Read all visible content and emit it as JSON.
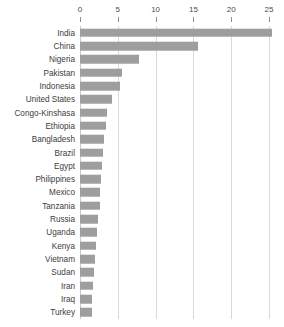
{
  "chart_data": {
    "type": "bar",
    "orientation": "horizontal",
    "title": "",
    "subtitle": "",
    "xlabel": "",
    "ylabel": "",
    "xlim": [
      0,
      26
    ],
    "grid": true,
    "legend": false,
    "axis_position": "top",
    "xticks": [
      0,
      5,
      10,
      15,
      20,
      25
    ],
    "xtick_labels": [
      "0",
      "5",
      "10",
      "15",
      "20",
      "25"
    ],
    "categories": [
      "India",
      "China",
      "Nigeria",
      "Pakistan",
      "Indonesia",
      "United States",
      "Congo-Kinshasa",
      "Ethiopia",
      "Bangladesh",
      "Brazil",
      "Egypt",
      "Philippines",
      "Mexico",
      "Tanzania",
      "Russia",
      "Uganda",
      "Kenya",
      "Vietnam",
      "Sudan",
      "Iran",
      "Iraq",
      "Turkey"
    ],
    "values": [
      25.4,
      15.6,
      7.8,
      5.5,
      5.3,
      4.2,
      3.6,
      3.4,
      3.2,
      3.1,
      2.9,
      2.8,
      2.7,
      2.6,
      2.4,
      2.2,
      2.1,
      2.0,
      1.9,
      1.7,
      1.6,
      1.6
    ],
    "series": [
      {
        "name": "value",
        "values": [
          25.4,
          15.6,
          7.8,
          5.5,
          5.3,
          4.2,
          3.6,
          3.4,
          3.2,
          3.1,
          2.9,
          2.8,
          2.7,
          2.6,
          2.4,
          2.2,
          2.1,
          2.0,
          1.9,
          1.7,
          1.6,
          1.6
        ]
      }
    ],
    "colors": {
      "bar": "#9e9e9e",
      "gridline": "#d9d9d9",
      "axis": "#8c8c8c",
      "text": "#3d3d3d",
      "background": "#ffffff"
    }
  }
}
